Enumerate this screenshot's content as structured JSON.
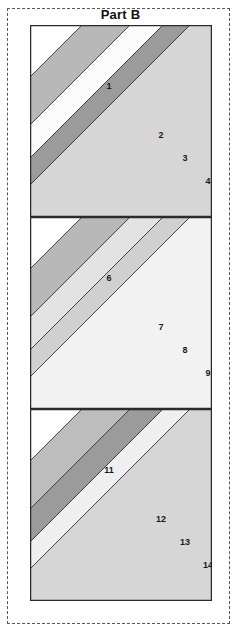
{
  "title": "Part B",
  "colors": {
    "page_background": "#ffffff",
    "cut_line": "#55585c",
    "block_outline": "#2b2b2b",
    "seam_line": "#3a3a3a",
    "shade_white": "#fefefe",
    "shade_lightest": "#f2f2f2",
    "shade_light": "#d6d6d6",
    "shade_medium": "#b8b8b8",
    "shade_dark": "#9b9b9b",
    "label_text": "#1a1a1a"
  },
  "blocks": [
    {
      "name": "block-top",
      "segments": [
        {
          "number": "1",
          "shade": "#fefefe",
          "label_x": 79,
          "label_y": 62
        },
        {
          "number": "2",
          "shade": "#b8b8b8",
          "label_x": 131,
          "label_y": 111
        },
        {
          "number": "3",
          "shade": "#fbfbfb",
          "label_x": 155,
          "label_y": 134
        },
        {
          "number": "4",
          "shade": "#9b9b9b",
          "label_x": 178,
          "label_y": 157
        },
        {
          "number": "5",
          "shade": "#d6d6d6",
          "label_x": 199,
          "label_y": 179
        }
      ]
    },
    {
      "name": "block-middle",
      "segments": [
        {
          "number": "6",
          "shade": "#fefefe",
          "label_x": 79,
          "label_y": 62
        },
        {
          "number": "7",
          "shade": "#b8b8b8",
          "label_x": 131,
          "label_y": 111
        },
        {
          "number": "8",
          "shade": "#e3e3e3",
          "label_x": 155,
          "label_y": 134
        },
        {
          "number": "9",
          "shade": "#d0d0d0",
          "label_x": 178,
          "label_y": 157
        },
        {
          "number": "10",
          "shade": "#f2f2f2",
          "label_x": 199,
          "label_y": 179
        }
      ]
    },
    {
      "name": "block-bottom",
      "segments": [
        {
          "number": "11",
          "shade": "#fefefe",
          "label_x": 79,
          "label_y": 62
        },
        {
          "number": "12",
          "shade": "#bdbdbd",
          "label_x": 131,
          "label_y": 111
        },
        {
          "number": "13",
          "shade": "#9b9b9b",
          "label_x": 155,
          "label_y": 134
        },
        {
          "number": "14",
          "shade": "#efefef",
          "label_x": 178,
          "label_y": 157
        },
        {
          "number": "15",
          "shade": "#d6d6d6",
          "label_x": 199,
          "label_y": 179
        }
      ]
    }
  ],
  "geometry": {
    "block_width": 182,
    "block_height": 192,
    "block_tops": [
      0,
      192,
      384
    ],
    "seam_offsets": [
      0,
      52,
      100,
      133,
      160
    ]
  }
}
